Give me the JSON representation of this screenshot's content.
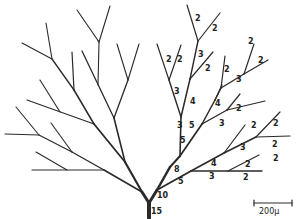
{
  "diagram": {
    "type": "branching-tree",
    "scale_bar": {
      "label": "200μ"
    },
    "trunk_label": "15",
    "labels": [
      {
        "text": "15",
        "x": 151,
        "y": 214
      },
      {
        "text": "10",
        "x": 157,
        "y": 198
      },
      {
        "text": "5",
        "x": 178,
        "y": 184
      },
      {
        "text": "8",
        "x": 174,
        "y": 172
      },
      {
        "text": "5",
        "x": 180,
        "y": 143
      },
      {
        "text": "5",
        "x": 189,
        "y": 128
      },
      {
        "text": "3",
        "x": 177,
        "y": 128
      },
      {
        "text": "4",
        "x": 190,
        "y": 104
      },
      {
        "text": "3",
        "x": 174,
        "y": 94
      },
      {
        "text": "2",
        "x": 166,
        "y": 62
      },
      {
        "text": "2",
        "x": 177,
        "y": 62
      },
      {
        "text": "3",
        "x": 198,
        "y": 57
      },
      {
        "text": "2",
        "x": 205,
        "y": 71
      },
      {
        "text": "2",
        "x": 195,
        "y": 21
      },
      {
        "text": "2",
        "x": 212,
        "y": 31
      },
      {
        "text": "2",
        "x": 224,
        "y": 72
      },
      {
        "text": "3",
        "x": 236,
        "y": 82
      },
      {
        "text": "2",
        "x": 248,
        "y": 44
      },
      {
        "text": "2",
        "x": 258,
        "y": 63
      },
      {
        "text": "4",
        "x": 215,
        "y": 106
      },
      {
        "text": "2",
        "x": 236,
        "y": 111
      },
      {
        "text": "3",
        "x": 219,
        "y": 126
      },
      {
        "text": "2",
        "x": 251,
        "y": 128
      },
      {
        "text": "2",
        "x": 273,
        "y": 126
      },
      {
        "text": "3",
        "x": 240,
        "y": 150
      },
      {
        "text": "2",
        "x": 272,
        "y": 147
      },
      {
        "text": "2",
        "x": 273,
        "y": 161
      },
      {
        "text": "4",
        "x": 211,
        "y": 166
      },
      {
        "text": "2",
        "x": 245,
        "y": 167
      },
      {
        "text": "3",
        "x": 209,
        "y": 179
      },
      {
        "text": "2",
        "x": 243,
        "y": 180
      }
    ]
  }
}
